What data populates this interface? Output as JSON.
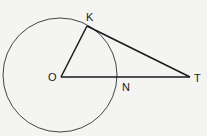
{
  "diagram": {
    "points": {
      "O": {
        "label": "O"
      },
      "K": {
        "label": "K"
      },
      "N": {
        "label": "N"
      },
      "T": {
        "label": "T"
      }
    },
    "segments": [
      "OK",
      "KT",
      "OT"
    ],
    "circle": {
      "center": "O",
      "through": "K"
    },
    "colors": {
      "stroke": "#1a1a1a",
      "circle": "#444444",
      "background": "#f4f4f2"
    }
  }
}
